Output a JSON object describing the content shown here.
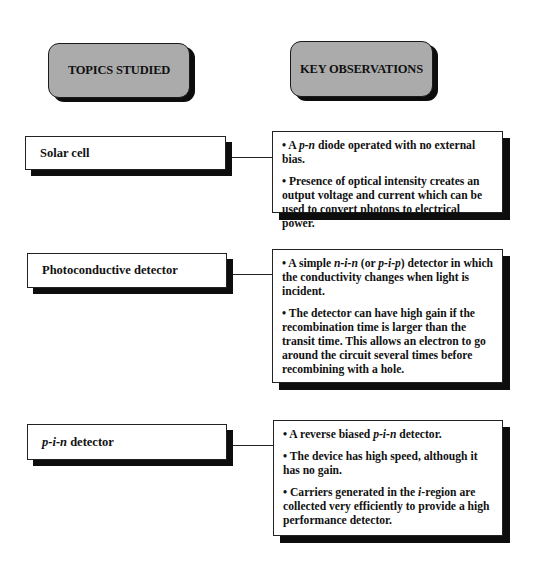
{
  "headers": {
    "topics": "TOPICS STUDIED",
    "observations": "KEY OBSERVATIONS"
  },
  "rows": [
    {
      "topic": {
        "pre": "",
        "italic": "",
        "post": "Solar cell"
      },
      "observations": [
        {
          "parts": [
            {
              "t": "• A ",
              "i": false
            },
            {
              "t": "p-n",
              "i": true
            },
            {
              "t": " diode operated with no external bias.",
              "i": false
            }
          ]
        },
        {
          "parts": [
            {
              "t": "• Presence of optical intensity creates an output voltage and current which can be used to convert photons to electrical power.",
              "i": false
            }
          ]
        }
      ]
    },
    {
      "topic": {
        "pre": "",
        "italic": "",
        "post": "Photoconductive detector"
      },
      "observations": [
        {
          "parts": [
            {
              "t": "• A simple ",
              "i": false
            },
            {
              "t": "n-i-n",
              "i": true
            },
            {
              "t": " (or ",
              "i": false
            },
            {
              "t": "p-i-p",
              "i": true
            },
            {
              "t": ") detector in which the conductivity changes when light is incident.",
              "i": false
            }
          ]
        },
        {
          "parts": [
            {
              "t": "• The detector can have high gain if the recombination time is larger than the transit time. This allows an electron to go around the circuit several times before recombining with a hole.",
              "i": false
            }
          ]
        }
      ]
    },
    {
      "topic": {
        "pre": "",
        "italic": "p-i-n",
        "post": " detector"
      },
      "observations": [
        {
          "parts": [
            {
              "t": "• A reverse biased ",
              "i": false
            },
            {
              "t": "p-i-n",
              "i": true
            },
            {
              "t": " detector.",
              "i": false
            }
          ]
        },
        {
          "parts": [
            {
              "t": "• The device has high speed, although it has no gain.",
              "i": false
            }
          ]
        },
        {
          "parts": [
            {
              "t": "• Carriers generated in the ",
              "i": false
            },
            {
              "t": "i",
              "i": true
            },
            {
              "t": "-region are collected very efficiently to provide a high performance detector.",
              "i": false
            }
          ]
        }
      ]
    }
  ],
  "colors": {
    "header_fill": "#ababab",
    "shadow": "#0d0d0d",
    "border": "#222222",
    "background": "#ffffff"
  }
}
